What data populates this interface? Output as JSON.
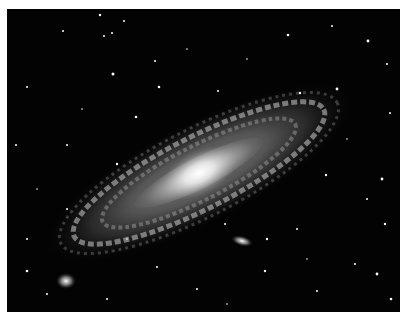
{
  "image": {
    "subject": "spiral galaxy with companion galaxies on star field",
    "background_color": "#030303",
    "border_color": "#ffffff",
    "galaxy": {
      "center": [
        199,
        173
      ],
      "tilt_deg": -27,
      "length": 330,
      "width": 90,
      "core_color": "#ffffff"
    },
    "companions": [
      {
        "name": "companion-galaxy-lower-middle",
        "center": [
          242,
          241
        ]
      },
      {
        "name": "companion-galaxy-lower-left",
        "center": [
          66,
          281
        ]
      }
    ]
  }
}
